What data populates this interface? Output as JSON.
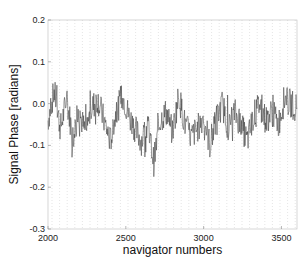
{
  "chart_data": {
    "type": "line",
    "title": "",
    "xlabel": "navigator numbers",
    "ylabel": "Signal Phase [radians]",
    "xlim": [
      2000,
      3600
    ],
    "ylim": [
      -0.3,
      0.2
    ],
    "xticks": [
      2000,
      2500,
      3000,
      3500
    ],
    "xtick_labels": [
      "2000",
      "2500",
      "3000",
      "3500"
    ],
    "yticks": [
      0.2,
      0.1,
      0.0,
      -0.1,
      -0.2,
      -0.3
    ],
    "ytick_labels": [
      "0.2",
      "0.1",
      "0.0",
      "-0.1",
      "-0.2",
      "-0.3"
    ],
    "grid": "dotted vertical lines at navigator intervals",
    "series": [
      {
        "name": "signal phase",
        "color": "#333333",
        "description": "noisy signal fluctuating around -0.03 rad, mostly within -0.15 to 0.07",
        "x": [
          2000,
          2040,
          2080,
          2120,
          2160,
          2200,
          2240,
          2280,
          2320,
          2360,
          2400,
          2440,
          2480,
          2520,
          2560,
          2600,
          2640,
          2680,
          2720,
          2760,
          2800,
          2840,
          2880,
          2920,
          2960,
          3000,
          3040,
          3080,
          3120,
          3160,
          3200,
          3240,
          3280,
          3320,
          3360,
          3400,
          3440,
          3480,
          3520,
          3560,
          3600
        ],
        "values": [
          -0.04,
          0.03,
          -0.06,
          0.01,
          -0.08,
          -0.02,
          -0.07,
          -0.01,
          0.01,
          -0.04,
          -0.09,
          -0.02,
          0.02,
          -0.03,
          -0.06,
          -0.09,
          -0.05,
          -0.14,
          -0.04,
          -0.02,
          -0.07,
          0.02,
          -0.05,
          -0.08,
          -0.06,
          -0.03,
          -0.1,
          -0.04,
          0.0,
          -0.06,
          -0.02,
          -0.05,
          -0.09,
          -0.03,
          0.0,
          -0.04,
          -0.02,
          -0.05,
          0.01,
          0.0,
          -0.01
        ]
      }
    ]
  }
}
